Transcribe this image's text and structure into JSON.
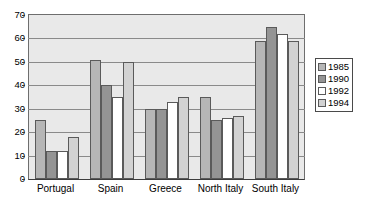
{
  "chart_data": {
    "type": "bar",
    "title": "",
    "subtitle": "",
    "xlabel": "",
    "ylabel": "",
    "categories": [
      "Portugal",
      "Spain",
      "Greece",
      "North Italy",
      "South Italy"
    ],
    "series": [
      {
        "name": "1985",
        "color": "#b6b6b6",
        "values": [
          25,
          51,
          30,
          35,
          59
        ]
      },
      {
        "name": "1990",
        "color": "#949494",
        "values": [
          12,
          40,
          30,
          25,
          65
        ]
      },
      {
        "name": "1992",
        "color": "#ffffff",
        "values": [
          12,
          35,
          33,
          26,
          62
        ]
      },
      {
        "name": "1994",
        "color": "#d2d2d2",
        "values": [
          18,
          50,
          35,
          27,
          59
        ]
      }
    ],
    "ylim": [
      0,
      70
    ],
    "ytick_values": [
      0,
      10,
      20,
      30,
      40,
      50,
      60,
      70
    ],
    "ytick_labels": [
      "0",
      "10",
      "20",
      "30",
      "40",
      "50",
      "60",
      "70"
    ],
    "grid": true,
    "legend_position": "right",
    "plot_background": "#e9e9e9",
    "gridline_color": "#8a8a8a",
    "axis_color": "#3c3c3c",
    "bar_border_color": "#5a5a5a"
  }
}
